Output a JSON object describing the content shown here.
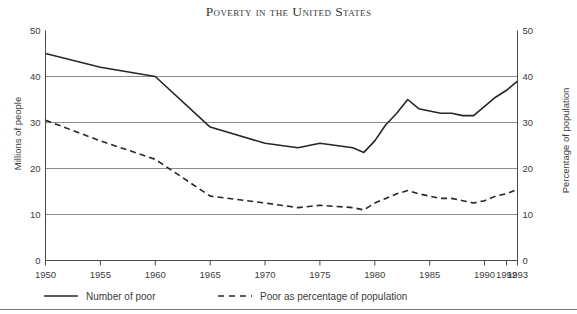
{
  "figure": {
    "title": "Poverty in the United States",
    "background": "#ffffff",
    "foreground": "#333333"
  },
  "legend": {
    "position": "below-axes",
    "entries": [
      {
        "label": "Number of poor",
        "style": "solid",
        "color": "#262626"
      },
      {
        "label": "Poor as percentage of population",
        "style": "dashed",
        "color": "#262626"
      }
    ]
  },
  "axes": {
    "left": {
      "title": "Millions of people",
      "ticks": [
        "0",
        "10",
        "20",
        "30",
        "40",
        "50"
      ],
      "min": 0,
      "max": 50
    },
    "right": {
      "title": "Percentage of population",
      "ticks": [
        "0",
        "10",
        "20",
        "30",
        "40",
        "50"
      ],
      "min": 0,
      "max": 50
    },
    "bottom": {
      "title": "",
      "ticks": [
        "1950",
        "1955",
        "1960",
        "1965",
        "1970",
        "1975",
        "1980",
        "1985",
        "1990",
        "1992",
        "1993"
      ],
      "min": 1950,
      "max": 1993
    }
  },
  "chart_data": {
    "type": "line",
    "title": "Poverty in the United States",
    "xlabel": "",
    "ylabel": "Millions of people",
    "y2label": "Percentage of population",
    "xlim": [
      1950,
      1993
    ],
    "ylim": [
      0,
      50
    ],
    "y2lim": [
      0,
      50
    ],
    "grid": "horizontal",
    "xticks": [
      1950,
      1955,
      1960,
      1965,
      1970,
      1975,
      1980,
      1985,
      1990,
      1992,
      1993
    ],
    "yticks": [
      0,
      10,
      20,
      30,
      40,
      50
    ],
    "x": [
      1950,
      1955,
      1960,
      1965,
      1970,
      1973,
      1975,
      1978,
      1979,
      1980,
      1981,
      1982,
      1983,
      1984,
      1985,
      1986,
      1987,
      1988,
      1989,
      1990,
      1991,
      1992,
      1993
    ],
    "series": [
      {
        "name": "Number of poor",
        "style": "solid",
        "axis": "left",
        "units": "millions",
        "values": [
          45.0,
          42.0,
          40.0,
          29.0,
          25.5,
          24.5,
          25.5,
          24.5,
          23.5,
          26.0,
          29.5,
          32.0,
          35.0,
          33.0,
          32.5,
          32.0,
          32.0,
          31.5,
          31.5,
          33.5,
          35.5,
          37.0,
          39.0
        ]
      },
      {
        "name": "Poor as percentage of population",
        "style": "dashed",
        "axis": "right",
        "units": "percent",
        "values": [
          30.5,
          26.0,
          22.0,
          14.0,
          12.5,
          11.5,
          12.0,
          11.5,
          11.0,
          12.5,
          13.5,
          14.5,
          15.2,
          14.5,
          14.0,
          13.5,
          13.5,
          13.0,
          12.5,
          13.0,
          14.0,
          14.5,
          15.5
        ]
      }
    ]
  }
}
